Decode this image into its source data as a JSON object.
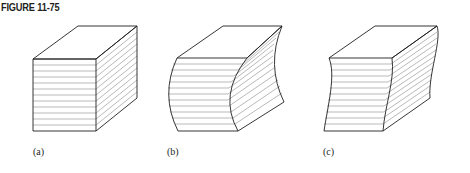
{
  "figure": {
    "title": "FIGURE 11-75",
    "panels": [
      {
        "id": "a",
        "label": "(a)",
        "description": "undeformed rectangular block with horizontal layer lines"
      },
      {
        "id": "b",
        "label": "(b)",
        "description": "block with curved (bowed) side faces"
      },
      {
        "id": "c",
        "label": "(c)",
        "description": "block with S-curved side faces"
      }
    ],
    "colors": {
      "outline": "#231f20",
      "hatch": "#8a8a8a",
      "background": "#ffffff"
    },
    "layer_lines_per_face": 11
  }
}
